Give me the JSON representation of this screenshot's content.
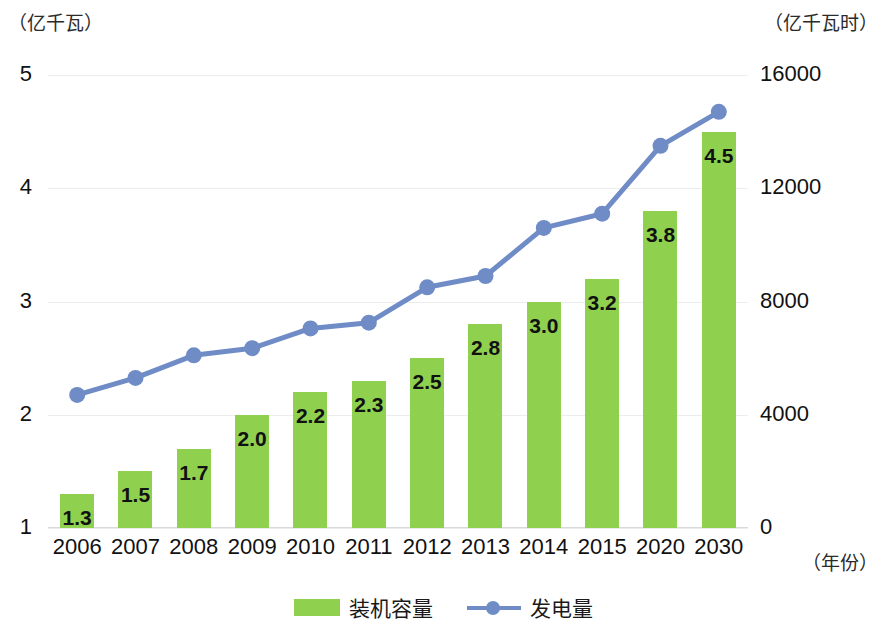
{
  "chart_data": {
    "type": "bar",
    "title": "",
    "subtitle": "",
    "xlabel": "（年份）",
    "ylabel": "（亿千瓦）",
    "y2label": "（亿千瓦时）",
    "grid": true,
    "legend_position": "bottom-center",
    "categories": [
      "2006",
      "2007",
      "2008",
      "2009",
      "2010",
      "2011",
      "2012",
      "2013",
      "2014",
      "2015",
      "2020",
      "2030"
    ],
    "ylim": [
      1,
      5
    ],
    "y2lim": [
      0,
      16000
    ],
    "yticks": [
      "5",
      "4",
      "3",
      "2",
      "1"
    ],
    "y2ticks": [
      "16000",
      "12000",
      "8000",
      "4000",
      "0"
    ],
    "ytick_values": [
      5,
      4,
      3,
      2,
      1
    ],
    "y2tick_values": [
      16000,
      12000,
      8000,
      4000,
      0
    ],
    "series": [
      {
        "name": "装机容量",
        "kind": "bar",
        "axis": "left",
        "unit": "亿千瓦",
        "color": "#8fd14f",
        "values": [
          1.3,
          1.5,
          1.7,
          2.0,
          2.2,
          2.3,
          2.5,
          2.8,
          3.0,
          3.2,
          3.8,
          4.5
        ],
        "labels": [
          "1.3",
          "1.5",
          "1.7",
          "2.0",
          "2.2",
          "2.3",
          "2.5",
          "2.8",
          "3.0",
          "3.2",
          "3.8",
          "4.5"
        ]
      },
      {
        "name": "发电量",
        "kind": "line",
        "axis": "right",
        "unit": "亿千瓦时",
        "color": "#6f8cc6",
        "values": [
          4700,
          5300,
          6100,
          6350,
          7050,
          7250,
          8500,
          8900,
          10600,
          11100,
          13500,
          14700
        ],
        "labels": []
      }
    ]
  },
  "legend": {
    "items": [
      {
        "label": "装机容量",
        "marker": "bar-swatch",
        "color": "#8fd14f"
      },
      {
        "label": "发电量",
        "marker": "line-marker-swatch",
        "color": "#6f8cc6"
      }
    ]
  },
  "colors": {
    "bar": "#8fd14f",
    "line": "#6f8cc6",
    "gridline": "#ededed",
    "text": "#111111",
    "background": "#ffffff"
  }
}
